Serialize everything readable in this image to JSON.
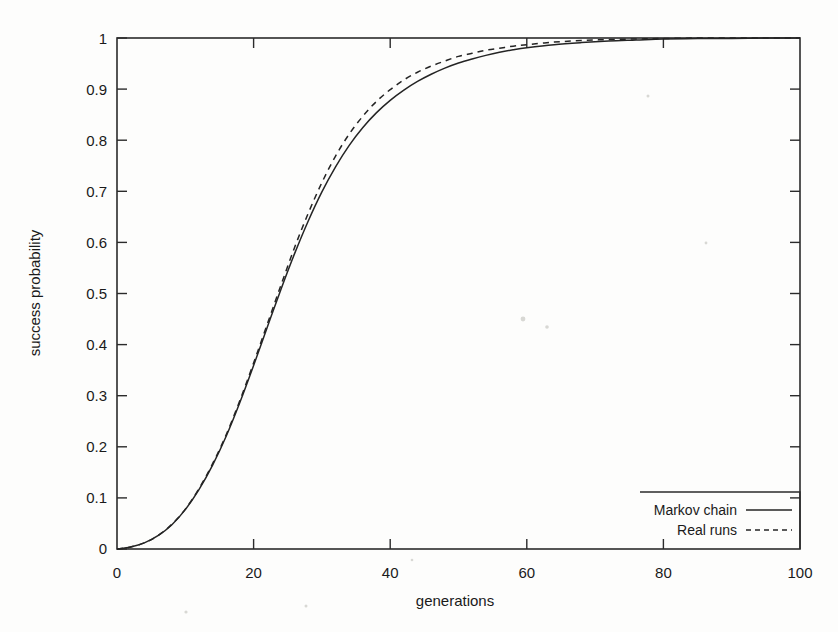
{
  "chart_data": {
    "type": "line",
    "title": "",
    "subtitle": "",
    "xlabel": "generations",
    "ylabel": "success probability",
    "xlim": [
      0,
      100
    ],
    "ylim": [
      0,
      1
    ],
    "xticks": [
      "0",
      "20",
      "40",
      "60",
      "80",
      "100"
    ],
    "xtick_values": [
      0,
      20,
      40,
      60,
      80,
      100
    ],
    "yticks": [
      "0",
      "0.1",
      "0.2",
      "0.3",
      "0.4",
      "0.5",
      "0.6",
      "0.7",
      "0.8",
      "0.9",
      "1"
    ],
    "ytick_values": [
      0,
      0.1,
      0.2,
      0.3,
      0.4,
      0.5,
      0.6,
      0.7,
      0.8,
      0.9,
      1.0
    ],
    "grid": false,
    "legend_position": "bottom-right",
    "line_color": "#242424",
    "background_color": "#fdfdfc",
    "x": [
      0,
      2,
      4,
      6,
      8,
      10,
      12,
      14,
      16,
      18,
      20,
      22,
      24,
      26,
      28,
      30,
      32,
      34,
      36,
      38,
      40,
      42,
      44,
      46,
      48,
      50,
      52,
      54,
      56,
      58,
      60,
      64,
      68,
      72,
      76,
      80,
      85,
      90,
      95,
      100
    ],
    "series": [
      {
        "name": "Markov chain",
        "style": "solid",
        "values": [
          0.0,
          0.004,
          0.012,
          0.026,
          0.047,
          0.077,
          0.116,
          0.164,
          0.221,
          0.287,
          0.359,
          0.434,
          0.508,
          0.578,
          0.642,
          0.699,
          0.748,
          0.79,
          0.825,
          0.854,
          0.878,
          0.898,
          0.915,
          0.929,
          0.941,
          0.951,
          0.959,
          0.966,
          0.972,
          0.977,
          0.981,
          0.987,
          0.991,
          0.994,
          0.996,
          0.998,
          0.999,
          0.999,
          1.0,
          1.0
        ]
      },
      {
        "name": "Real runs",
        "style": "dashed",
        "values": [
          0.0,
          0.004,
          0.012,
          0.026,
          0.048,
          0.078,
          0.118,
          0.167,
          0.224,
          0.291,
          0.364,
          0.44,
          0.516,
          0.59,
          0.657,
          0.717,
          0.769,
          0.812,
          0.847,
          0.876,
          0.899,
          0.918,
          0.933,
          0.945,
          0.955,
          0.964,
          0.97,
          0.976,
          0.98,
          0.984,
          0.987,
          0.992,
          0.995,
          0.997,
          0.998,
          0.999,
          1.0,
          1.0,
          1.0,
          1.0
        ]
      }
    ]
  },
  "legend": {
    "entries": [
      {
        "label": "Markov chain",
        "style": "solid"
      },
      {
        "label": "Real runs",
        "style": "dashed"
      }
    ]
  },
  "axes": {
    "x_title": "generations",
    "y_title": "success probability"
  }
}
